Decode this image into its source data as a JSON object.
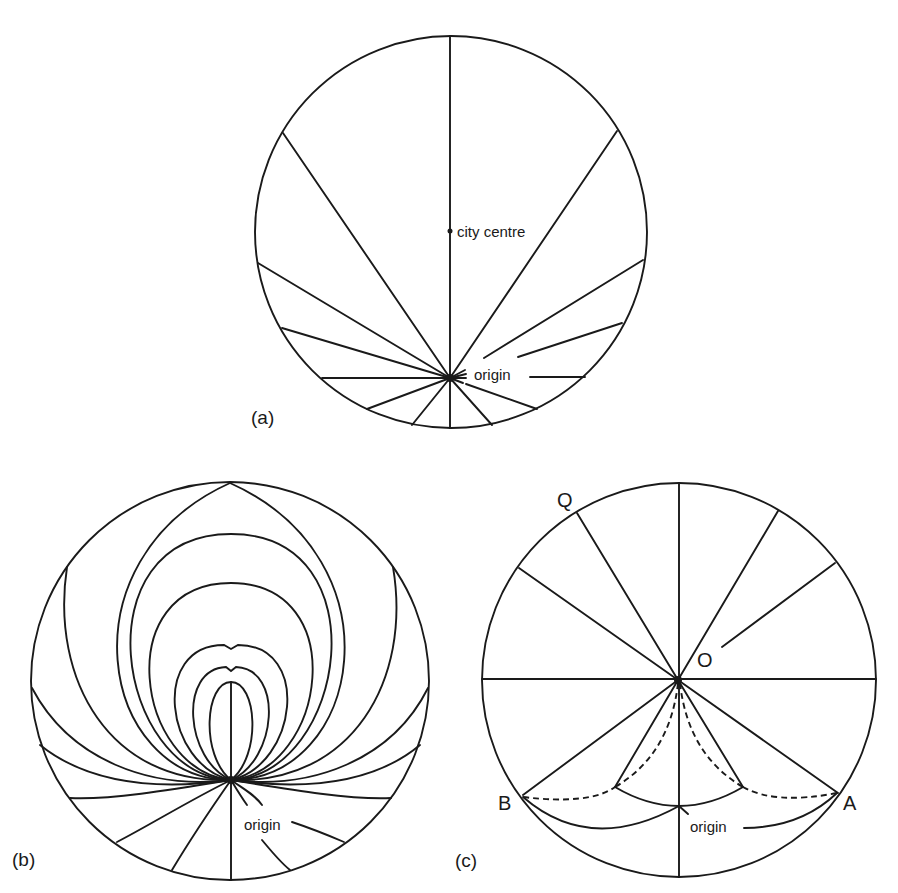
{
  "figure": {
    "panels": [
      {
        "id": "a",
        "label": "(a)",
        "description": "Straight radial routes from an off-centre origin to the boundary of a circular city",
        "annotations": {
          "city_centre": "city centre",
          "origin": "origin"
        }
      },
      {
        "id": "b",
        "label": "(b)",
        "description": "Curved loop-shaped routes radiating from an off-centre origin within a circular city",
        "annotations": {
          "origin": "origin"
        }
      },
      {
        "id": "c",
        "label": "(c)",
        "description": "Radial routes through centre O with solid and dashed arcs connecting points B and A",
        "annotations": {
          "Q": "Q",
          "O": "O",
          "B": "B",
          "A": "A",
          "origin": "origin"
        }
      }
    ],
    "colors": {
      "ink": "#1a1a1a",
      "background": "#ffffff"
    }
  }
}
